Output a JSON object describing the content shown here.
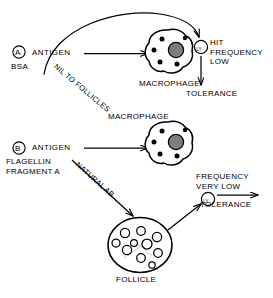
{
  "diagram": {
    "type": "biological-flow-diagram",
    "background_color": "#ffffff",
    "ink_color": "#000000",
    "nucleus_color": "#808080"
  },
  "panels": [
    {
      "id": "A",
      "tag": "A",
      "antigen_label": "ANTIGEN",
      "antigen_name": "BSA",
      "path_label": "NIL TO FOLLICLES",
      "cell_label": "MACROPHAGE",
      "lymphocyte_label": "LY",
      "outcome_lines": [
        "HIT",
        "FREQUENCY",
        "LOW"
      ],
      "terminal_label": "TOLERANCE"
    },
    {
      "id": "B",
      "tag": "B",
      "antigen_label": "ANTIGEN",
      "antigen_name_lines": [
        "FLAGELLIN",
        "FRAGMENT A"
      ],
      "path_label": "NATURAL AB",
      "cell_label": "MACROPHAGE",
      "follicle_label": "FOLLICLE",
      "lymphocyte_label": "LY",
      "outcome_lines": [
        "FREQUENCY",
        "VERY LOW"
      ],
      "terminal_label": "TOLERANCE"
    }
  ],
  "labels": {
    "a_tag": "A",
    "a_antigen": "ANTIGEN",
    "a_bsa": "BSA",
    "a_nil_to_follicles": "NIL TO FOLLICLES",
    "a_macrophage": "MACROPHAGE",
    "a_ly": "LY",
    "a_hit_frequency_low": "HIT\nFREQUENCY\nLOW",
    "a_tolerance": "TOLERANCE",
    "b_tag": "B",
    "b_antigen": "ANTIGEN",
    "b_flagellin": "FLAGELLIN\nFRAGMENT A",
    "b_natural_ab": "NATURAL AB",
    "b_macrophage": "MACROPHAGE",
    "b_follicle": "FOLLICLE",
    "b_ly": "LY",
    "b_frequency_very_low": "FREQUENCY\nVERY LOW",
    "b_tolerance": "TOLERANCE"
  }
}
